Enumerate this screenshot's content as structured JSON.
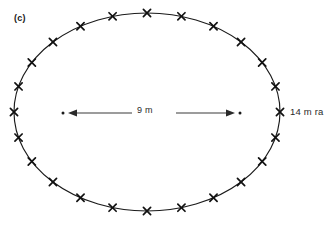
{
  "figure": {
    "panel_label": "(c)",
    "shape": "ellipse",
    "stroke_color": "#1a1a1a",
    "background_color": "#ffffff"
  },
  "annotations": {
    "diameter_label": "9 m",
    "radius_label": "14 m ra",
    "radius_label_full": "14 m radius",
    "radius_label_clipped": "true"
  },
  "chart_data": {
    "type": "scatter",
    "title": "(c)",
    "xlabel": "",
    "ylabel": "",
    "ellipse": {
      "center_x": 147,
      "center_y": 112,
      "radius_x": 133,
      "radius_y": 99
    },
    "marker_count": 24,
    "marker_symbol": "x",
    "marker_angles_deg": [
      0,
      15,
      30,
      45,
      60,
      75,
      90,
      105,
      120,
      135,
      150,
      165,
      180,
      195,
      210,
      225,
      240,
      255,
      270,
      285,
      300,
      315,
      330,
      345
    ],
    "dimension_arrow": {
      "label": "9 m",
      "value": 9,
      "unit": "m",
      "x_start": 68,
      "x_end": 235,
      "y": 113,
      "double_headed": true,
      "end_dots": true
    },
    "radius_annotation": {
      "label": "14 m ra",
      "value": 14,
      "unit": "m",
      "anchor_x": 280,
      "anchor_y": 113
    },
    "grid": false,
    "legend": false
  }
}
